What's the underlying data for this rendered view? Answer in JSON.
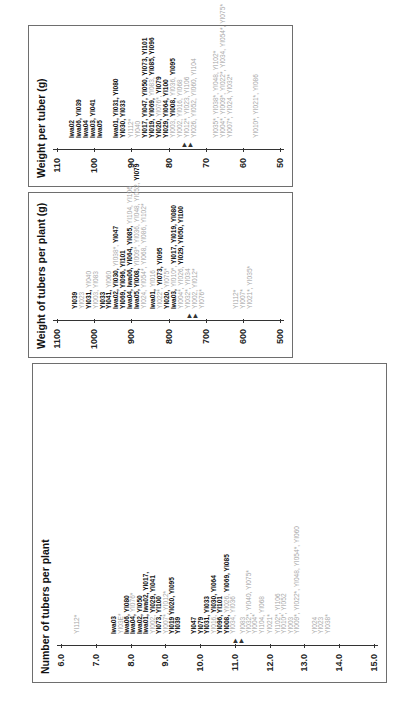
{
  "figure": "Three ranked scales of potato clones (Iwa / YI lines); bold = above mean, grey = below mean, * = marked clone",
  "colors": {
    "above_mean": "#111111",
    "below_mean": "#a8a8a8",
    "frame": "#6e6e6e"
  },
  "chart_data": [
    {
      "type": "table",
      "title": "Weight per tuber (g)",
      "axis_ticks": [
        "110",
        "100",
        "90",
        "80",
        "70",
        "60",
        "50"
      ],
      "mean_marker": "▲▲ ~72",
      "rows": [
        {
          "pos": 0.08,
          "items": [
            {
              "t": "Iwa02",
              "s": "b"
            }
          ]
        },
        {
          "pos": 0.11,
          "items": [
            {
              "t": "Iwa06, ",
              "s": "b"
            },
            {
              "t": "YI039",
              "s": "b"
            }
          ]
        },
        {
          "pos": 0.14,
          "items": [
            {
              "t": "Iwa04",
              "s": "b"
            }
          ]
        },
        {
          "pos": 0.17,
          "items": [
            {
              "t": "Iwa03, ",
              "s": "b"
            },
            {
              "t": "YI041",
              "s": "b"
            }
          ]
        },
        {
          "pos": 0.2,
          "items": [
            {
              "t": "Iwa05",
              "s": "b"
            }
          ]
        },
        {
          "pos": 0.27,
          "items": [
            {
              "t": "Iwa01, ",
              "s": "b"
            },
            {
              "t": "YI031, YI080",
              "s": "b"
            }
          ]
        },
        {
          "pos": 0.3,
          "items": [
            {
              "t": "YI030, YI033",
              "s": "b"
            }
          ]
        },
        {
          "pos": 0.335,
          "items": [
            {
              "t": "YI112*",
              "s": "g"
            }
          ]
        },
        {
          "pos": 0.365,
          "items": [
            {
              "t": "YI040",
              "s": "g"
            }
          ]
        },
        {
          "pos": 0.395,
          "items": [
            {
              "t": "YI017, YI047, YI050, YI073, YI101",
              "s": "b"
            }
          ]
        },
        {
          "pos": 0.425,
          "items": [
            {
              "t": "YI019, YI069, ",
              "s": "b"
            },
            {
              "t": "YI083, ",
              "s": "g"
            },
            {
              "t": "YI085, YI096",
              "s": "b"
            }
          ]
        },
        {
          "pos": 0.455,
          "items": [
            {
              "t": "YI020, ",
              "s": "b"
            },
            {
              "t": "YI076*, ",
              "s": "g"
            },
            {
              "t": "YI079",
              "s": "b"
            }
          ]
        },
        {
          "pos": 0.485,
          "items": [
            {
              "t": "YI029, YI064, YI100",
              "s": "b"
            }
          ]
        },
        {
          "pos": 0.515,
          "items": [
            {
              "t": "YI003, ",
              "s": "g"
            },
            {
              "t": "YI008, ",
              "s": "b"
            },
            {
              "t": "YI036, ",
              "s": "g"
            },
            {
              "t": "YI095",
              "s": "b"
            }
          ]
        },
        {
          "pos": 0.545,
          "items": [
            {
              "t": "YI002, YI016, YI068",
              "s": "g"
            }
          ]
        },
        {
          "pos": 0.575,
          "items": [
            {
              "t": "YI012*, YI023, YI106",
              "s": "g"
            }
          ]
        },
        {
          "pos": 0.605,
          "items": [
            {
              "t": "YI026, YI052, YI060, YI104",
              "s": "g"
            }
          ]
        },
        {
          "pos": 0.7,
          "items": [
            {
              "t": "YI035*, YI038*, YI048, YI102*",
              "s": "g"
            }
          ]
        },
        {
          "pos": 0.73,
          "items": [
            {
              "t": "YI004*, YI009*, YI022*, YI034, YI054*, YI075*",
              "s": "g"
            }
          ]
        },
        {
          "pos": 0.76,
          "items": [
            {
              "t": "YI007*, YI024, YI032*",
              "s": "g"
            }
          ]
        },
        {
          "pos": 0.875,
          "items": [
            {
              "t": "YI010*, YI021*, YI086",
              "s": "g"
            }
          ]
        }
      ]
    },
    {
      "type": "table",
      "title": "Weight of tubers per plant (g)",
      "axis_ticks": [
        "1100",
        "1000",
        "900",
        "800",
        "700",
        "600",
        "500"
      ],
      "mean_marker": "▲▲ ~625",
      "rows": [
        {
          "pos": 0.09,
          "items": [
            {
              "t": "YI039",
              "s": "b"
            }
          ]
        },
        {
          "pos": 0.12,
          "items": [
            {
              "t": "YI023",
              "s": "g"
            }
          ]
        },
        {
          "pos": 0.15,
          "items": [
            {
              "t": "YI031, ",
              "s": "b"
            },
            {
              "t": "YI040",
              "s": "g"
            }
          ]
        },
        {
          "pos": 0.18,
          "items": [
            {
              "t": "YI003, YI083",
              "s": "g"
            }
          ]
        },
        {
          "pos": 0.21,
          "items": [
            {
              "t": "YI033",
              "s": "b"
            }
          ]
        },
        {
          "pos": 0.24,
          "items": [
            {
              "t": "YI041, ",
              "s": "b"
            },
            {
              "t": "YI060",
              "s": "g"
            }
          ]
        },
        {
          "pos": 0.27,
          "items": [
            {
              "t": "Iwa02, ",
              "s": "b"
            },
            {
              "t": "YI030, ",
              "s": "b"
            },
            {
              "t": "YI038*, ",
              "s": "g"
            },
            {
              "t": "YI047",
              "s": "b"
            }
          ]
        },
        {
          "pos": 0.3,
          "items": [
            {
              "t": "YI069, YI096, YI101",
              "s": "b"
            }
          ]
        },
        {
          "pos": 0.33,
          "items": [
            {
              "t": "Iwa04, Iwa06, ",
              "s": "b"
            },
            {
              "t": "YI064, YI085, ",
              "s": "b"
            },
            {
              "t": "YI104, YI106",
              "s": "g"
            }
          ]
        },
        {
          "pos": 0.36,
          "items": [
            {
              "t": "Iwa05, ",
              "s": "b"
            },
            {
              "t": "YI008, ",
              "s": "b"
            },
            {
              "t": "YI009*, YI036, YI048, YI052, ",
              "s": "g"
            },
            {
              "t": "YI079",
              "s": "b"
            }
          ]
        },
        {
          "pos": 0.39,
          "items": [
            {
              "t": "YI024, YI054*, YI068, YI086, YI102*",
              "s": "g"
            }
          ]
        },
        {
          "pos": 0.43,
          "items": [
            {
              "t": "Iwa01, ",
              "s": "b"
            },
            {
              "t": "YI016",
              "s": "g"
            }
          ]
        },
        {
          "pos": 0.46,
          "items": [
            {
              "t": "YI022*, ",
              "s": "g"
            },
            {
              "t": "YI073, YI095",
              "s": "b"
            }
          ]
        },
        {
          "pos": 0.49,
          "items": [
            {
              "t": "YI020, ",
              "s": "b"
            },
            {
              "t": "YI075*",
              "s": "g"
            }
          ]
        },
        {
          "pos": 0.52,
          "items": [
            {
              "t": "Iwa03, ",
              "s": "b"
            },
            {
              "t": "YI010*, ",
              "s": "g"
            },
            {
              "t": "YI017, YI019, YI080",
              "s": "b"
            }
          ]
        },
        {
          "pos": 0.55,
          "items": [
            {
              "t": "YI004*, YI026, ",
              "s": "g"
            },
            {
              "t": "YI029, YI050, YI100",
              "s": "b"
            }
          ]
        },
        {
          "pos": 0.58,
          "items": [
            {
              "t": "YI032*, YI034",
              "s": "g"
            }
          ]
        },
        {
          "pos": 0.61,
          "items": [
            {
              "t": "YI002, YI012*",
              "s": "g"
            }
          ]
        },
        {
          "pos": 0.64,
          "items": [
            {
              "t": "YI076*",
              "s": "g"
            }
          ]
        },
        {
          "pos": 0.79,
          "items": [
            {
              "t": "YI112*",
              "s": "g"
            }
          ]
        },
        {
          "pos": 0.82,
          "items": [
            {
              "t": "YI007*",
              "s": "g"
            }
          ]
        },
        {
          "pos": 0.85,
          "items": [
            {
              "t": "YI021*, YI035*",
              "s": "g"
            }
          ]
        }
      ]
    },
    {
      "type": "table",
      "title": "Number of tubers per plant",
      "axis_ticks": [
        "6.0",
        "7.0",
        "8.0",
        "9.0",
        "10.0",
        "11.0",
        "12.0",
        "13.0",
        "14.0",
        "15.0"
      ],
      "mean_marker": "▲▲ ~11.8",
      "rows": [
        {
          "pos": 0.06,
          "items": [
            {
              "t": "YI112*",
              "s": "g"
            }
          ]
        },
        {
          "pos": 0.175,
          "items": [
            {
              "t": "Iwa03",
              "s": "b"
            }
          ]
        },
        {
          "pos": 0.195,
          "items": [
            {
              "t": "YI03E*",
              "s": "g"
            }
          ]
        },
        {
          "pos": 0.215,
          "items": [
            {
              "t": "Iwa06, YI080",
              "s": "b"
            }
          ]
        },
        {
          "pos": 0.235,
          "items": [
            {
              "t": "Iwa04, ",
              "s": "b"
            },
            {
              "t": "YI076*",
              "s": "g"
            }
          ]
        },
        {
          "pos": 0.255,
          "items": [
            {
              "t": "Iwa02, YI050",
              "s": "b"
            }
          ]
        },
        {
          "pos": 0.275,
          "items": [
            {
              "t": "Iwa01, Iwa02, YI017,",
              "s": "b"
            }
          ]
        },
        {
          "pos": 0.295,
          "items": [
            {
              "t": "YI002, ",
              "s": "g"
            },
            {
              "t": "YI029, YI041",
              "s": "b"
            }
          ]
        },
        {
          "pos": 0.315,
          "items": [
            {
              "t": "YI073, YI100",
              "s": "b"
            }
          ]
        },
        {
          "pos": 0.335,
          "items": [
            {
              "t": "YI007*, YI012*",
              "s": "g"
            }
          ]
        },
        {
          "pos": 0.355,
          "items": [
            {
              "t": "YI019  YI020, YI095",
              "s": "b"
            }
          ]
        },
        {
          "pos": 0.375,
          "items": [
            {
              "t": "YI039",
              "s": "b"
            }
          ]
        },
        {
          "pos": 0.425,
          "items": [
            {
              "t": "YI047",
              "s": "b"
            }
          ]
        },
        {
          "pos": 0.445,
          "items": [
            {
              "t": "YI079",
              "s": "b"
            }
          ]
        },
        {
          "pos": 0.465,
          "items": [
            {
              "t": "YI031, YI033",
              "s": "b"
            }
          ]
        },
        {
          "pos": 0.485,
          "items": [
            {
              "t": "YI016, ",
              "s": "g"
            },
            {
              "t": "YI030, YI064",
              "s": "b"
            }
          ]
        },
        {
          "pos": 0.505,
          "items": [
            {
              "t": "YI096, YI101",
              "s": "b"
            }
          ]
        },
        {
          "pos": 0.525,
          "items": [
            {
              "t": "YI008, ",
              "s": "b"
            },
            {
              "t": "YI026, ",
              "s": "g"
            },
            {
              "t": "YI069, YI085",
              "s": "b"
            }
          ]
        },
        {
          "pos": 0.545,
          "items": [
            {
              "t": "YI034, YI036",
              "s": "g"
            }
          ]
        },
        {
          "pos": 0.575,
          "items": [
            {
              "t": "YI083",
              "s": "g"
            }
          ]
        },
        {
          "pos": 0.595,
          "items": [
            {
              "t": "YI032*, YI040, YI075*",
              "s": "g"
            }
          ]
        },
        {
          "pos": 0.615,
          "items": [
            {
              "t": "YI004*",
              "s": "g"
            }
          ]
        },
        {
          "pos": 0.635,
          "items": [
            {
              "t": "YI104, YI068",
              "s": "g"
            }
          ]
        },
        {
          "pos": 0.66,
          "items": [
            {
              "t": "YI021*",
              "s": "g"
            }
          ]
        },
        {
          "pos": 0.685,
          "items": [
            {
              "t": "YI102*, YI106",
              "s": "g"
            }
          ]
        },
        {
          "pos": 0.705,
          "items": [
            {
              "t": "YI010*, YI052",
              "s": "g"
            }
          ]
        },
        {
          "pos": 0.725,
          "items": [
            {
              "t": "YI003",
              "s": "g"
            }
          ]
        },
        {
          "pos": 0.745,
          "items": [
            {
              "t": "YI009*, YI022*, YI048, YI054*, YI060",
              "s": "g"
            }
          ]
        },
        {
          "pos": 0.8,
          "items": [
            {
              "t": "YI024",
              "s": "g"
            }
          ]
        },
        {
          "pos": 0.82,
          "items": [
            {
              "t": "YI023",
              "s": "g"
            }
          ]
        },
        {
          "pos": 0.84,
          "items": [
            {
              "t": "YI038*",
              "s": "g"
            }
          ]
        }
      ]
    }
  ]
}
